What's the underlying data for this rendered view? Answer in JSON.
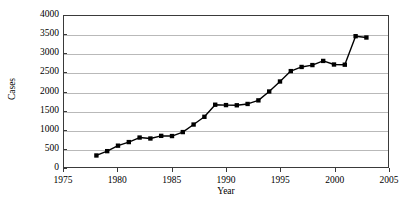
{
  "chart_data": {
    "type": "line",
    "title": "",
    "xlabel": "Year",
    "ylabel": "Cases",
    "xlim": [
      1975,
      2005
    ],
    "ylim": [
      0,
      4000
    ],
    "xticks": [
      1975,
      1980,
      1985,
      1990,
      1995,
      2000,
      2005
    ],
    "yticks": [
      0,
      500,
      1000,
      1500,
      2000,
      2500,
      3000,
      3500,
      4000
    ],
    "grid": "horizontal",
    "legend": "none",
    "marker": "square",
    "line_color": "#000000",
    "marker_color": "#000000",
    "grid_color": "#b9b9b9",
    "axis_color": "#3a3a3a",
    "series": [
      {
        "name": "Cases",
        "x": [
          1978,
          1979,
          1980,
          1981,
          1982,
          1983,
          1984,
          1985,
          1986,
          1987,
          1988,
          1989,
          1990,
          1991,
          1992,
          1993,
          1994,
          1995,
          1996,
          1997,
          1998,
          1999,
          2000,
          2001,
          2002,
          2003
        ],
        "values": [
          305,
          420,
          565,
          660,
          780,
          755,
          825,
          820,
          925,
          1125,
          1330,
          1650,
          1640,
          1635,
          1670,
          1765,
          2000,
          2265,
          2540,
          2650,
          2700,
          2810,
          2715,
          2710,
          3465,
          3430
        ]
      }
    ]
  }
}
